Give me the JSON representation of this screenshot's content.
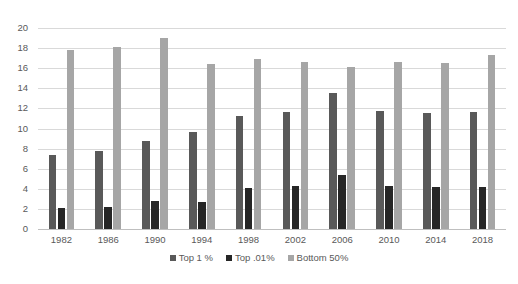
{
  "chart_data": {
    "type": "bar",
    "title": "",
    "subtitle": "",
    "xlabel": "",
    "ylabel": "",
    "categories": [
      "1982",
      "1986",
      "1990",
      "1994",
      "1998",
      "2002",
      "2006",
      "2010",
      "2014",
      "2018"
    ],
    "series": [
      {
        "name": "Top 1 %",
        "color": "#595959",
        "values": [
          7.4,
          7.8,
          8.8,
          9.7,
          11.2,
          11.6,
          13.5,
          11.7,
          11.5,
          11.6
        ]
      },
      {
        "name": "Top .01%",
        "color": "#262626",
        "values": [
          2.1,
          2.2,
          2.8,
          2.7,
          4.1,
          4.3,
          5.4,
          4.3,
          4.2,
          4.2
        ]
      },
      {
        "name": "Bottom 50%",
        "color": "#a6a6a6",
        "values": [
          17.8,
          18.1,
          19.0,
          16.4,
          16.9,
          16.6,
          16.1,
          16.6,
          16.5,
          17.3
        ]
      }
    ],
    "ylim": [
      0,
      20
    ],
    "ytick_step": 2,
    "yticks": [
      "0",
      "2",
      "4",
      "6",
      "8",
      "10",
      "12",
      "14",
      "16",
      "18",
      "20"
    ],
    "grid": true,
    "legend_position": "bottom",
    "legend": [
      {
        "label": "Top 1 %",
        "color": "#595959"
      },
      {
        "label": "Top .01%",
        "color": "#262626"
      },
      {
        "label": "Bottom 50%",
        "color": "#a6a6a6"
      }
    ],
    "background_color": "#ffffff",
    "gridline_color": "#d9d9d9",
    "text_color": "#595959"
  }
}
